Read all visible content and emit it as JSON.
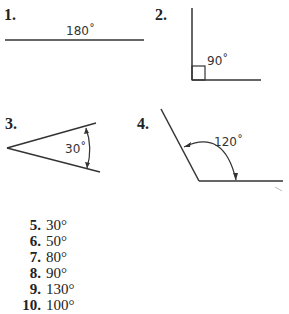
{
  "figures": [
    {
      "number": "1.",
      "angle_label": "180˚",
      "type": "straight-angle"
    },
    {
      "number": "2.",
      "angle_label": "90˚",
      "type": "right-angle"
    },
    {
      "number": "3.",
      "angle_label": "30˚",
      "type": "acute-angle"
    },
    {
      "number": "4.",
      "angle_label": "120˚",
      "type": "obtuse-angle"
    }
  ],
  "answers": [
    {
      "number": "5.",
      "value": "30°"
    },
    {
      "number": "6.",
      "value": "50°"
    },
    {
      "number": "7.",
      "value": "80°"
    },
    {
      "number": "8.",
      "value": "90°"
    },
    {
      "number": "9.",
      "value": "130°"
    },
    {
      "number": "10.",
      "value": "100°"
    }
  ]
}
